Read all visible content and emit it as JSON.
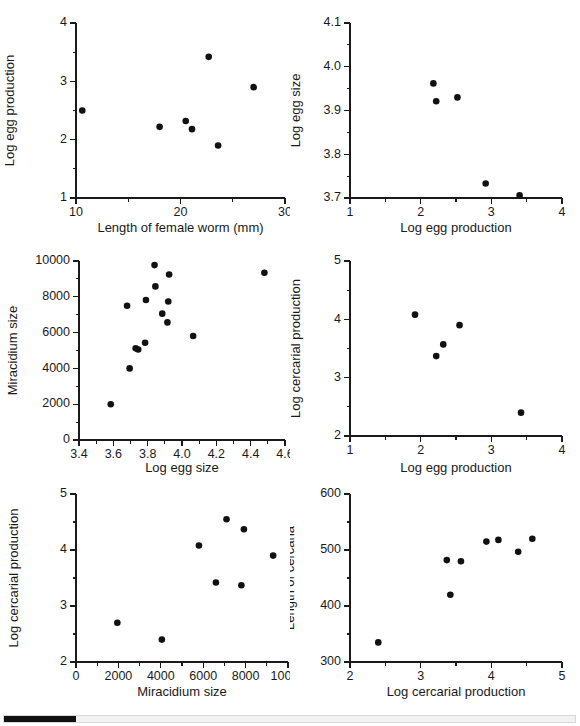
{
  "figure": {
    "background_color": "#ffffff",
    "point_color": "#111111",
    "axis_color": "#1a1a1a"
  },
  "scrollbar": {
    "name": "horizontal-scrollbar",
    "thumb_label": "",
    "track_color": "#f2f2f2",
    "thumb_color": "#111111"
  },
  "chart_data": [
    {
      "id": "panel-1",
      "type": "scatter",
      "title": "",
      "xlabel": "Length of female worm (mm)",
      "ylabel": "Log egg production",
      "xlim": [
        10,
        30
      ],
      "ylim": [
        1,
        4
      ],
      "xticks": [
        10,
        20,
        30
      ],
      "xtick_labels": [
        "10",
        "20",
        "30"
      ],
      "yticks": [
        1,
        2,
        3,
        4
      ],
      "ytick_labels": [
        "1",
        "2",
        "3",
        "4"
      ],
      "x_minor_step": 5,
      "y_minor_step": 0.5,
      "grid": false,
      "legend": "none",
      "points": [
        {
          "x": 10.6,
          "y": 2.5
        },
        {
          "x": 18.0,
          "y": 2.22
        },
        {
          "x": 20.5,
          "y": 2.32
        },
        {
          "x": 21.1,
          "y": 2.18
        },
        {
          "x": 22.7,
          "y": 3.42
        },
        {
          "x": 23.6,
          "y": 1.9
        },
        {
          "x": 27.0,
          "y": 2.9
        }
      ]
    },
    {
      "id": "panel-2",
      "type": "scatter",
      "title": "",
      "xlabel": "Log egg production",
      "ylabel": "Log egg size",
      "xlim": [
        1,
        4
      ],
      "ylim": [
        3.7,
        4.1
      ],
      "xticks": [
        1,
        2,
        3,
        4
      ],
      "xtick_labels": [
        "1",
        "2",
        "3",
        "4"
      ],
      "yticks": [
        3.7,
        3.8,
        3.9,
        4.0,
        4.1
      ],
      "ytick_labels": [
        "3.7",
        "3.8",
        "3.9",
        "4.0",
        "4.1"
      ],
      "x_minor_step": 0.5,
      "y_minor_step": 0.05,
      "grid": false,
      "legend": "none",
      "points": [
        {
          "x": 2.18,
          "y": 3.962
        },
        {
          "x": 2.22,
          "y": 3.921
        },
        {
          "x": 2.52,
          "y": 3.93
        },
        {
          "x": 2.92,
          "y": 3.733
        },
        {
          "x": 3.4,
          "y": 3.706
        }
      ]
    },
    {
      "id": "panel-3",
      "type": "scatter",
      "title": "",
      "xlabel": "Log egg size",
      "ylabel": "Miracidium size",
      "xlim": [
        3.4,
        4.6
      ],
      "ylim": [
        0,
        10000
      ],
      "xticks": [
        3.4,
        3.6,
        3.8,
        4.0,
        4.2,
        4.4,
        4.6
      ],
      "xtick_labels": [
        "3.4",
        "3.6",
        "3.8",
        "4.0",
        "4.2",
        "4.4",
        "4.6"
      ],
      "yticks": [
        0,
        2000,
        4000,
        6000,
        8000,
        10000
      ],
      "ytick_labels": [
        "0",
        "2000",
        "4000",
        "6000",
        "8000",
        "10000"
      ],
      "x_minor_step": 0.1,
      "y_minor_step": 1000,
      "grid": false,
      "legend": "none",
      "points": [
        {
          "x": 3.585,
          "y": 2000
        },
        {
          "x": 3.695,
          "y": 4000
        },
        {
          "x": 3.68,
          "y": 7500
        },
        {
          "x": 3.73,
          "y": 5120
        },
        {
          "x": 3.745,
          "y": 5060
        },
        {
          "x": 3.785,
          "y": 5430
        },
        {
          "x": 3.79,
          "y": 7820
        },
        {
          "x": 3.84,
          "y": 9770
        },
        {
          "x": 3.845,
          "y": 8580
        },
        {
          "x": 3.885,
          "y": 7060
        },
        {
          "x": 3.915,
          "y": 6570
        },
        {
          "x": 3.92,
          "y": 7740
        },
        {
          "x": 3.925,
          "y": 9250
        },
        {
          "x": 4.065,
          "y": 5810
        },
        {
          "x": 4.48,
          "y": 9340
        }
      ]
    },
    {
      "id": "panel-4",
      "type": "scatter",
      "title": "",
      "xlabel": "Log egg production",
      "ylabel": "Log cercarial production",
      "xlim": [
        1,
        4
      ],
      "ylim": [
        2,
        5
      ],
      "xticks": [
        1,
        2,
        3,
        4
      ],
      "xtick_labels": [
        "1",
        "2",
        "3",
        "4"
      ],
      "yticks": [
        2,
        3,
        4,
        5
      ],
      "ytick_labels": [
        "2",
        "3",
        "4",
        "5"
      ],
      "x_minor_step": 0.5,
      "y_minor_step": 0.5,
      "grid": false,
      "legend": "none",
      "points": [
        {
          "x": 1.92,
          "y": 4.08
        },
        {
          "x": 2.22,
          "y": 3.37
        },
        {
          "x": 2.32,
          "y": 3.57
        },
        {
          "x": 2.55,
          "y": 3.9
        },
        {
          "x": 3.42,
          "y": 2.4
        }
      ]
    },
    {
      "id": "panel-5",
      "type": "scatter",
      "title": "",
      "xlabel": "Miracidium size",
      "ylabel": "Log cercarial production",
      "xlim": [
        0,
        10000
      ],
      "ylim": [
        2,
        5
      ],
      "xticks": [
        0,
        2000,
        4000,
        6000,
        8000,
        10000
      ],
      "xtick_labels": [
        "0",
        "2000",
        "4000",
        "6000",
        "8000",
        "10000"
      ],
      "yticks": [
        2,
        3,
        4,
        5
      ],
      "ytick_labels": [
        "2",
        "3",
        "4",
        "5"
      ],
      "x_minor_step": 1000,
      "y_minor_step": 0.5,
      "grid": false,
      "legend": "none",
      "points": [
        {
          "x": 1950,
          "y": 2.7
        },
        {
          "x": 4050,
          "y": 2.4
        },
        {
          "x": 5800,
          "y": 4.08
        },
        {
          "x": 6600,
          "y": 3.42
        },
        {
          "x": 7100,
          "y": 4.55
        },
        {
          "x": 7800,
          "y": 3.37
        },
        {
          "x": 7920,
          "y": 4.37
        },
        {
          "x": 9300,
          "y": 3.9
        }
      ]
    },
    {
      "id": "panel-6",
      "type": "scatter",
      "title": "",
      "xlabel": "Log cercarial production",
      "ylabel": "Length of cercaria",
      "xlim": [
        2,
        5
      ],
      "ylim": [
        300,
        600
      ],
      "xticks": [
        2,
        3,
        4,
        5
      ],
      "xtick_labels": [
        "2",
        "3",
        "4",
        "5"
      ],
      "yticks": [
        300,
        400,
        500,
        600
      ],
      "ytick_labels": [
        "300",
        "400",
        "500",
        "600"
      ],
      "x_minor_step": 0.5,
      "y_minor_step": 50,
      "grid": false,
      "legend": "none",
      "points": [
        {
          "x": 2.4,
          "y": 335
        },
        {
          "x": 3.37,
          "y": 482
        },
        {
          "x": 3.42,
          "y": 420
        },
        {
          "x": 3.57,
          "y": 480
        },
        {
          "x": 3.93,
          "y": 515
        },
        {
          "x": 4.1,
          "y": 518
        },
        {
          "x": 4.38,
          "y": 497
        },
        {
          "x": 4.58,
          "y": 520
        }
      ]
    }
  ]
}
